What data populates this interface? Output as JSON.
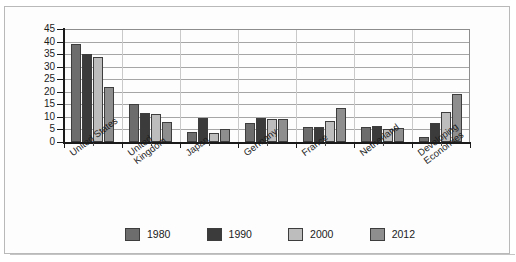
{
  "chart_data": {
    "type": "bar",
    "title": "",
    "subtitle": "",
    "xlabel": "",
    "ylabel": "",
    "ylim": [
      0,
      45
    ],
    "ytick_step": 5,
    "yticks": [
      "45",
      "40",
      "35",
      "30",
      "25",
      "20",
      "15",
      "10",
      "5",
      "0"
    ],
    "grid": true,
    "legend_position": "bottom",
    "categories": [
      "United States",
      "United\nKingdom",
      "Japan",
      "Germany",
      "France",
      "Netherland",
      "Developing\nEconomies"
    ],
    "series": [
      {
        "name": "1980",
        "color": "#6d6d6d",
        "values": [
          39,
          15,
          4,
          7.5,
          6,
          6,
          2
        ]
      },
      {
        "name": "1990",
        "color": "#3b3b3b",
        "values": [
          35,
          11.5,
          9.5,
          9.5,
          6,
          6.5,
          7.5
        ]
      },
      {
        "name": "2000",
        "color": "#bdbdbd",
        "values": [
          34,
          11,
          3.5,
          9,
          8.5,
          5,
          12
        ]
      },
      {
        "name": "2012",
        "color": "#8e8e8e",
        "values": [
          22,
          8,
          5,
          9,
          13.5,
          5.5,
          19
        ]
      }
    ]
  },
  "legend": {
    "entries": [
      {
        "label": "1980",
        "color": "#6d6d6d"
      },
      {
        "label": "1990",
        "color": "#3b3b3b"
      },
      {
        "label": "2000",
        "color": "#bdbdbd"
      },
      {
        "label": "2012",
        "color": "#8e8e8e"
      }
    ]
  }
}
